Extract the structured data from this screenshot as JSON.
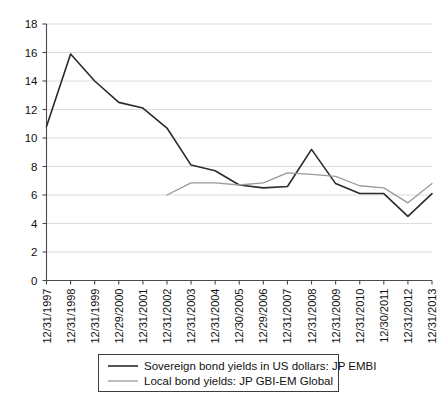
{
  "chart_data": {
    "type": "line",
    "title": "",
    "subtitle": "",
    "xlabel": "",
    "ylabel": "",
    "ylim": [
      0,
      18
    ],
    "ytick_step": 2,
    "yticks": [
      "0",
      "2",
      "4",
      "6",
      "8",
      "10",
      "12",
      "14",
      "16",
      "18"
    ],
    "grid": true,
    "legend_position": "bottom",
    "categories": [
      "12/31/1997",
      "12/31/1998",
      "12/31/1999",
      "12/29/2000",
      "12/31/2001",
      "12/31/2002",
      "12/31/2003",
      "12/31/2004",
      "12/30/2005",
      "12/29/2006",
      "12/31/2007",
      "12/31/2008",
      "12/31/2009",
      "12/31/2010",
      "12/30/2011",
      "12/31/2012",
      "12/31/2013"
    ],
    "series": [
      {
        "name": "Sovereign bond yields in US dollars: JP EMBI",
        "color": "#2b2b2b",
        "values": [
          10.8,
          15.9,
          14.0,
          12.5,
          12.1,
          10.7,
          8.1,
          7.7,
          6.7,
          6.5,
          6.6,
          9.2,
          6.8,
          6.1,
          6.1,
          4.5,
          6.1
        ]
      },
      {
        "name": "Local bond yields: JP GBI-EM Global",
        "color": "#9a9a9a",
        "values": [
          null,
          null,
          null,
          null,
          null,
          6.0,
          6.85,
          6.85,
          6.7,
          6.85,
          7.55,
          7.45,
          7.3,
          6.65,
          6.5,
          5.45,
          6.8
        ]
      }
    ]
  },
  "legend": {
    "entries": [
      {
        "label": "Sovereign bond yields in US dollars: JP EMBI",
        "swatch": "line-swatch-dark"
      },
      {
        "label": "Local bond yields: JP GBI-EM Global",
        "swatch": "line-swatch-gray"
      }
    ]
  }
}
